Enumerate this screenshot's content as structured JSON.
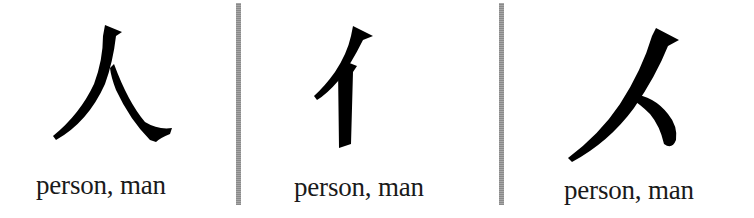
{
  "panels": [
    {
      "character": "人",
      "form": "standalone",
      "label": "person, man"
    },
    {
      "character": "亻",
      "form": "left-side radical",
      "label": "person, man"
    },
    {
      "character": "𠆢",
      "form": "top radical",
      "label": "person, man"
    }
  ],
  "colors": {
    "glyph": "#000000",
    "text": "#1a1a1a",
    "divider": "#999999",
    "background": "#ffffff"
  }
}
